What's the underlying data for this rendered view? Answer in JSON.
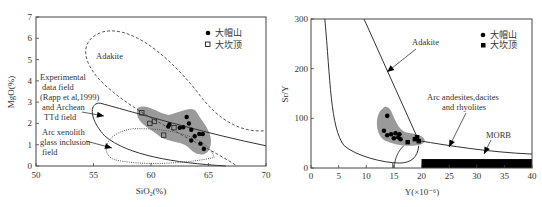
{
  "chart_data": [
    {
      "type": "scatter",
      "title": "",
      "xlabel": "SiO2(%)",
      "ylabel": "MgO(%)",
      "xlim": [
        50,
        70
      ],
      "ylim": [
        0,
        7
      ],
      "xticks": [
        50,
        55,
        60,
        65,
        70
      ],
      "yticks": [
        0,
        1,
        2,
        3,
        4,
        5,
        6,
        7
      ],
      "grid": false,
      "legend_position": "upper right",
      "legend": [
        {
          "label": "大帽山",
          "marker": "filled-circle"
        },
        {
          "label": "大坎顶",
          "marker": "open-square"
        }
      ],
      "annotations": [
        "Adakite",
        "Experimental data field (Rapp et al,1999) and Archean TTd field",
        "Arc xenolith glass inclusion field"
      ],
      "series": [
        {
          "name": "大帽山",
          "marker": "filled-circle",
          "points": [
            [
              61.5,
              1.85
            ],
            [
              61.6,
              1.95
            ],
            [
              62.5,
              1.8
            ],
            [
              62.8,
              1.82
            ],
            [
              63.1,
              2.3
            ],
            [
              63.3,
              2.0
            ],
            [
              63.5,
              1.7
            ],
            [
              63.5,
              1.2
            ],
            [
              63.8,
              1.4
            ],
            [
              64.2,
              1.5
            ],
            [
              64.3,
              1.05
            ],
            [
              64.5,
              1.5
            ],
            [
              64.6,
              0.8
            ]
          ]
        },
        {
          "name": "大坎顶",
          "marker": "open-square",
          "points": [
            [
              59.2,
              2.5
            ],
            [
              59.9,
              2.0
            ],
            [
              60.3,
              2.1
            ],
            [
              61.1,
              1.45
            ],
            [
              62.0,
              1.8
            ]
          ]
        }
      ]
    },
    {
      "type": "scatter",
      "title": "",
      "xlabel": "Y(×10⁻⁶)",
      "ylabel": "Sr/Y",
      "xlim": [
        0,
        40
      ],
      "ylim": [
        0,
        300
      ],
      "xticks": [
        0,
        5,
        10,
        15,
        20,
        25,
        30,
        35,
        40
      ],
      "yticks": [
        0,
        100,
        200,
        300
      ],
      "grid": false,
      "legend_position": "upper right",
      "legend": [
        {
          "label": "大帽山",
          "marker": "filled-circle"
        },
        {
          "label": "大坎顶",
          "marker": "filled-square"
        }
      ],
      "annotations": [
        "Adakite",
        "Arc andesites,dacites and rhyolites",
        "MORB"
      ],
      "series": [
        {
          "name": "大帽山",
          "marker": "filled-circle",
          "points": [
            [
              13.8,
              105
            ],
            [
              13.2,
              75
            ],
            [
              13.8,
              66
            ],
            [
              14.5,
              68
            ],
            [
              15.0,
              60
            ],
            [
              15.3,
              70
            ],
            [
              15.8,
              62
            ],
            [
              16.2,
              58
            ],
            [
              16.0,
              68
            ]
          ]
        },
        {
          "name": "大坎顶",
          "marker": "filled-square",
          "points": [
            [
              17.5,
              52
            ],
            [
              18.8,
              58
            ],
            [
              19.2,
              62
            ],
            [
              19.5,
              54
            ]
          ]
        }
      ],
      "regions": [
        {
          "name": "MORB",
          "x": [
            20,
            40
          ],
          "y": [
            0,
            18
          ],
          "fill": "#000000"
        }
      ]
    }
  ],
  "colors": {
    "field_gray": "#9a9a9a",
    "line": "#333333",
    "marker": "#000000"
  }
}
